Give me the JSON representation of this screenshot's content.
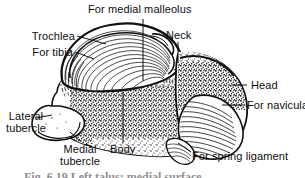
{
  "figure": {
    "caption_partial": "Fig. 6.19  Left talus: medial surface",
    "ink_color": "#111111",
    "background_color": "#ffffff"
  },
  "labels": {
    "for_medial_malleolus": "For medial malleolus",
    "trochlea": "Trochlea",
    "for_tibia": "For tibia",
    "neck": "Neck",
    "head": "Head",
    "for_navicular": "For navicular",
    "for_spring_ligament": "For spring ligament",
    "lateral_tubercle_line1": "Lateral",
    "lateral_tubercle_line2": "tubercle",
    "medial_tubercle_line1": "Medial",
    "medial_tubercle_line2": "tubercle",
    "body": "Body"
  }
}
